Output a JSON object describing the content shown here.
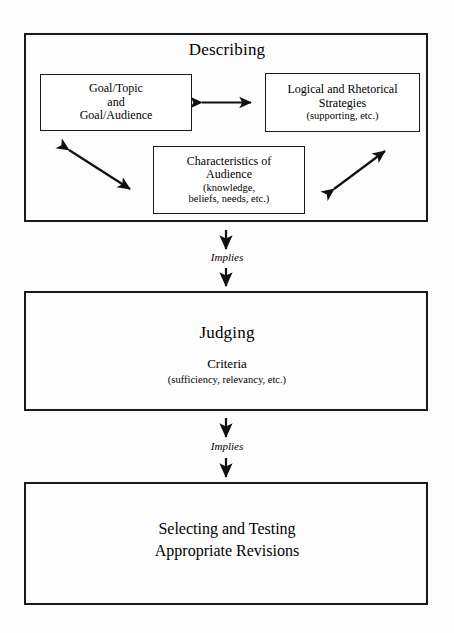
{
  "diagram": {
    "ink_color": "#1a1a1a",
    "background_color": "#fdfdfd",
    "stages": [
      {
        "id": "describing",
        "heading": "Describing",
        "boxes": [
          {
            "id": "goal-topic-audience",
            "lines": [
              "Goal/Topic",
              "and",
              "Goal/Audience"
            ]
          },
          {
            "id": "logical-rhetorical-strategies",
            "lines": [
              "Logical and Rhetorical",
              "Strategies",
              "(supporting, etc.)"
            ]
          },
          {
            "id": "characteristics-of-audience",
            "lines": [
              "Characteristics of",
              "Audience",
              "(knowledge,",
              "beliefs, needs, etc.)"
            ]
          }
        ]
      },
      {
        "id": "judging",
        "heading": "Judging",
        "subheading": "Criteria",
        "note": "(sufficiency, relevancy, etc.)"
      },
      {
        "id": "selecting-testing",
        "lines": [
          "Selecting and Testing",
          "Appropriate Revisions"
        ]
      }
    ],
    "connectors": [
      {
        "id": "implies-1",
        "label": "Implies"
      },
      {
        "id": "implies-2",
        "label": "Implies"
      }
    ],
    "internal_arrows": [
      {
        "id": "goal-to-strategies",
        "kind": "double-headed-horizontal"
      },
      {
        "id": "goal-to-audience",
        "kind": "double-headed-diagonal"
      },
      {
        "id": "audience-to-strategies",
        "kind": "double-headed-diagonal"
      }
    ]
  }
}
